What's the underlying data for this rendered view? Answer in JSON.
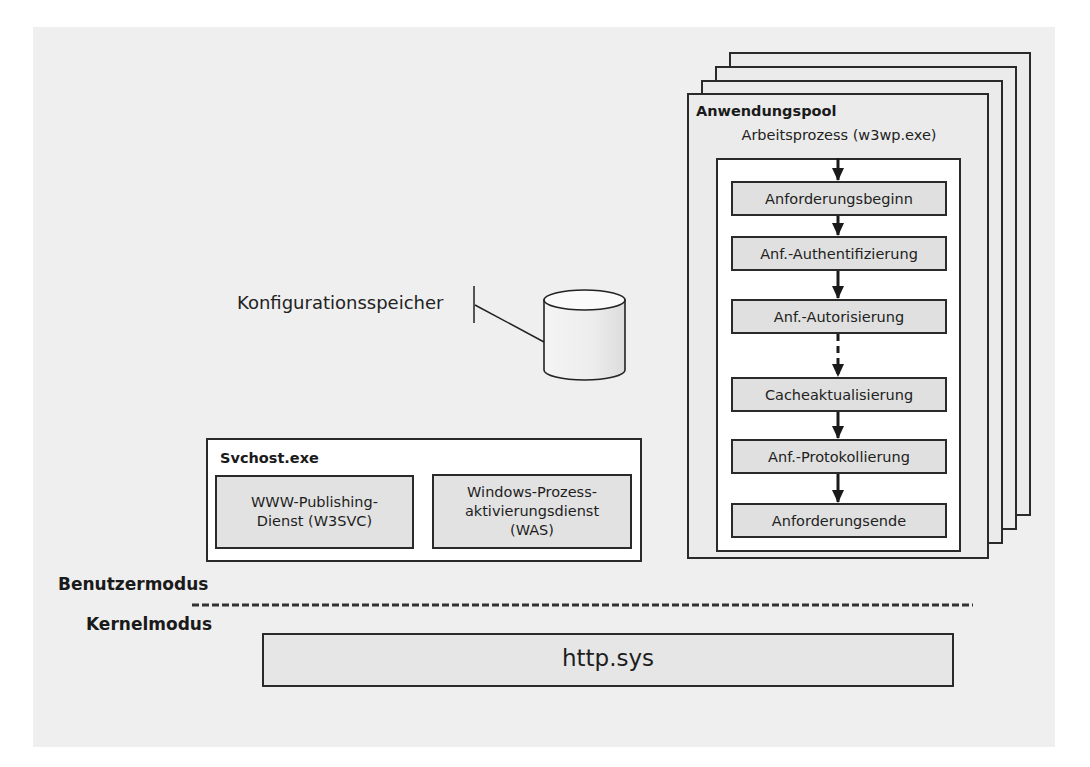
{
  "diagram": {
    "app_pool": {
      "title": "Anwendungspool",
      "worker_process_label": "Arbeitsprozess (w3wp.exe)",
      "stack_count": 4,
      "pipeline_steps": [
        "Anforderungsbeginn",
        "Anf.-Authentifizierung",
        "Anf.-Autorisierung",
        "Cacheaktualisierung",
        "Anf.-Protokollierung",
        "Anforderungsende"
      ],
      "arrows": [
        {
          "from": "start",
          "to": "Anforderungsbeginn",
          "style": "solid"
        },
        {
          "from": "Anforderungsbeginn",
          "to": "Anf.-Authentifizierung",
          "style": "solid"
        },
        {
          "from": "Anf.-Authentifizierung",
          "to": "Anf.-Autorisierung",
          "style": "solid"
        },
        {
          "from": "Anf.-Autorisierung",
          "to": "Cacheaktualisierung",
          "style": "dashed"
        },
        {
          "from": "Cacheaktualisierung",
          "to": "Anf.-Protokollierung",
          "style": "solid"
        },
        {
          "from": "Anf.-Protokollierung",
          "to": "Anforderungsende",
          "style": "solid"
        }
      ]
    },
    "config_store": {
      "label": "Konfigurationsspeicher",
      "icon": "database-cylinder-icon"
    },
    "svchost": {
      "title": "Svchost.exe",
      "services": [
        {
          "lines": [
            "WWW-Publishing-",
            "Dienst (W3SVC)"
          ]
        },
        {
          "lines": [
            "Windows-Prozess-",
            "aktivierungsdienst",
            "(WAS)"
          ]
        }
      ]
    },
    "modes": {
      "user_mode": "Benutzermodus",
      "kernel_mode": "Kernelmodus"
    },
    "kernel": {
      "http_sys": "http.sys"
    },
    "colors": {
      "background_panel": "#efefef",
      "box_fill": "#e0e0e0",
      "border": "#2a2a2a",
      "inner_panel": "#ffffff"
    }
  }
}
